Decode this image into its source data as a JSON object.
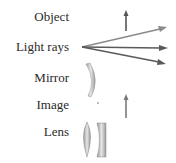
{
  "legend": {
    "items": [
      {
        "label": "Object",
        "symbol": "upright-arrow"
      },
      {
        "label": "Light rays",
        "symbol": "diverging-arrows"
      },
      {
        "label": "Mirror",
        "symbol": "curved-mirror"
      },
      {
        "label": "Image",
        "symbol": "upright-arrow-light"
      },
      {
        "label": "Lens",
        "symbol": "convex-and-concave-lens"
      }
    ]
  },
  "colors": {
    "text": "#2a2a2a",
    "arrow_dark": "#555555",
    "arrow_light": "#8a8a8a",
    "lens_fill": "#bdbdbd"
  }
}
